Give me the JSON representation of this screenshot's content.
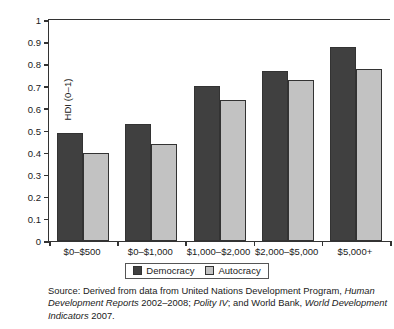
{
  "chart_data": {
    "type": "bar",
    "title": "",
    "xlabel": "",
    "ylabel": "HDI (0–1)",
    "ylim": [
      0,
      1
    ],
    "ytick_labels": [
      "1",
      "0.9",
      "0.8",
      "0.7",
      "0.6",
      "0.5",
      "0.4",
      "0.3",
      "0.2",
      "0.1",
      "0"
    ],
    "ytick_values": [
      1,
      0.9,
      0.8,
      0.7,
      0.6,
      0.5,
      0.4,
      0.3,
      0.2,
      0.1,
      0
    ],
    "grid": false,
    "legend_position": "bottom-center",
    "categories": [
      "$0–$500",
      "$0–$1,000",
      "$1,000–$2,000",
      "$2,000–$5,000",
      "$5,000+"
    ],
    "series": [
      {
        "name": "Democracy",
        "color": "#404040",
        "values": [
          0.49,
          0.53,
          0.7,
          0.77,
          0.88
        ]
      },
      {
        "name": "Autocracy",
        "color": "#c2c2c2",
        "values": [
          0.4,
          0.44,
          0.64,
          0.73,
          0.78
        ]
      }
    ]
  },
  "legend": {
    "items": [
      {
        "label": "Democracy"
      },
      {
        "label": "Autocracy"
      }
    ]
  },
  "source_note": {
    "line1_a": "Source: Derived from data from United Nations Development Program,",
    "line2_a": "Human Development Reports",
    "line2_b": " 2002–2008; ",
    "line2_c": "Polity IV",
    "line2_d": "; and World Bank, ",
    "line2_e": "World",
    "line3_a": "Development Indicators",
    "line3_b": " 2007.",
    "full_text": "Source: Derived from data from United Nations Development Program, Human Development Reports 2002–2008; Polity IV; and World Bank, World Development Indicators 2007."
  }
}
